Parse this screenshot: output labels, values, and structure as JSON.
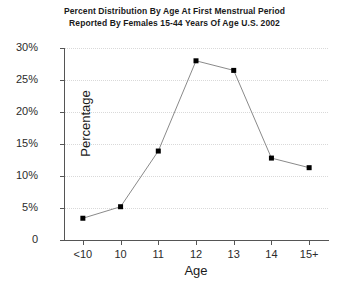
{
  "chart_data": {
    "type": "line",
    "title": "Percent Distribution By Age At First Menstrual Period",
    "subtitle": "Reported By Females 15-44 Years Of Age U.S. 2002",
    "xlabel": "Age",
    "ylabel": "Percentage",
    "categories": [
      "<10",
      "10",
      "11",
      "12",
      "13",
      "14",
      "15+"
    ],
    "values": [
      3.4,
      5.2,
      13.9,
      28.0,
      26.5,
      12.8,
      11.3
    ],
    "ylim": [
      0,
      30
    ],
    "yticks": [
      0,
      5,
      10,
      15,
      20,
      25,
      30
    ],
    "ytick_labels": [
      "0",
      "5%",
      "10%",
      "15%",
      "20%",
      "25%",
      "30%"
    ],
    "grid": true,
    "grid_axis": "y",
    "grid_style": "dotted",
    "legend": false,
    "marker": "square",
    "line_color": "#8a8a8a",
    "marker_color": "#000000",
    "grid_color": "#d9d9d9",
    "axis_color": "#555555",
    "background": "#ffffff"
  }
}
